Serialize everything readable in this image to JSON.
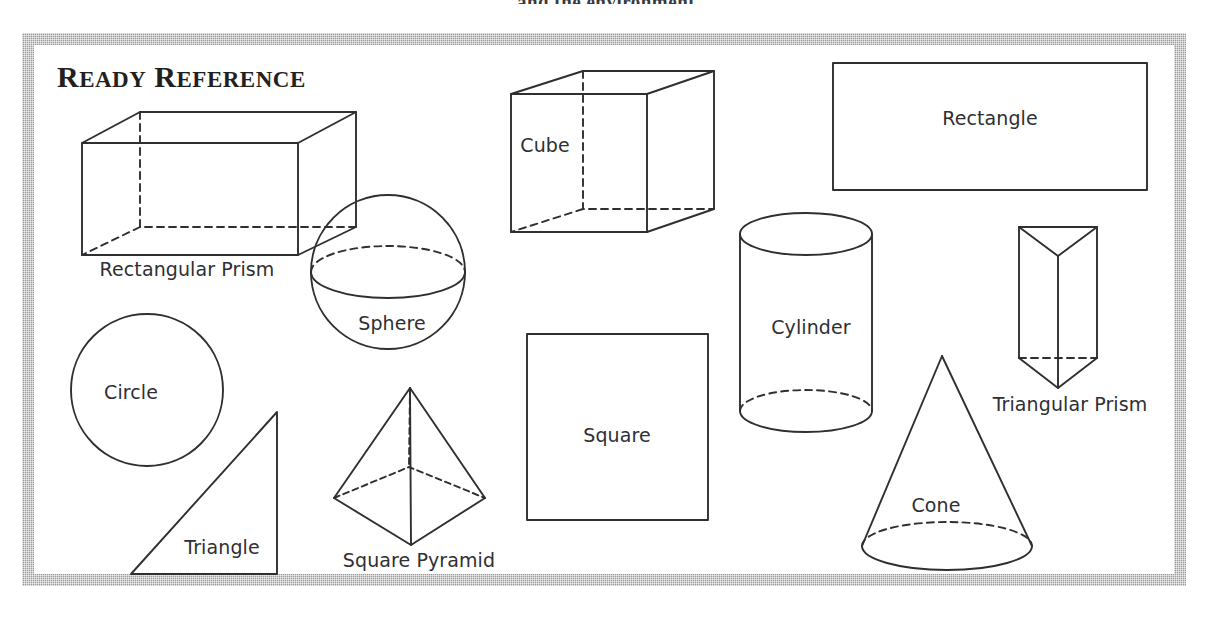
{
  "page": {
    "running_header": "and the environment",
    "panel_title_full": "READY REFERENCE",
    "panel_title_lead": "R",
    "panel_title_rest_a": "EADY",
    "panel_title_lead2": "R",
    "panel_title_rest_b": "EFERENCE",
    "ink_color": "#2f2f33",
    "frame_color": "#9a9a9c",
    "background_color": "#ffffff"
  },
  "shapes": [
    {
      "id": "rectangular-prism",
      "label": "Rectangular Prism",
      "kind": "3d-solid",
      "label_x": 187,
      "label_y": 269,
      "has_hidden_edges": true
    },
    {
      "id": "cube",
      "label": "Cube",
      "kind": "3d-solid",
      "label_x": 545,
      "label_y": 145,
      "has_hidden_edges": true
    },
    {
      "id": "rectangle",
      "label": "Rectangle",
      "kind": "2d-plane",
      "label_x": 990,
      "label_y": 118,
      "has_hidden_edges": false
    },
    {
      "id": "sphere",
      "label": "Sphere",
      "kind": "3d-solid",
      "label_x": 392,
      "label_y": 323,
      "has_hidden_edges": true
    },
    {
      "id": "cylinder",
      "label": "Cylinder",
      "kind": "3d-solid",
      "label_x": 811,
      "label_y": 327,
      "has_hidden_edges": true
    },
    {
      "id": "triangular-prism",
      "label": "Triangular Prism",
      "kind": "3d-solid",
      "label_x": 1070,
      "label_y": 404,
      "has_hidden_edges": true
    },
    {
      "id": "circle",
      "label": "Circle",
      "kind": "2d-plane",
      "label_x": 131,
      "label_y": 392,
      "has_hidden_edges": false
    },
    {
      "id": "square",
      "label": "Square",
      "kind": "2d-plane",
      "label_x": 617,
      "label_y": 435,
      "has_hidden_edges": false
    },
    {
      "id": "triangle",
      "label": "Triangle",
      "kind": "2d-plane",
      "label_x": 222,
      "label_y": 547,
      "has_hidden_edges": false
    },
    {
      "id": "square-pyramid",
      "label": "Square Pyramid",
      "kind": "3d-solid",
      "label_x": 419,
      "label_y": 560,
      "has_hidden_edges": true
    },
    {
      "id": "cone",
      "label": "Cone",
      "kind": "3d-solid",
      "label_x": 936,
      "label_y": 505,
      "has_hidden_edges": true
    }
  ]
}
